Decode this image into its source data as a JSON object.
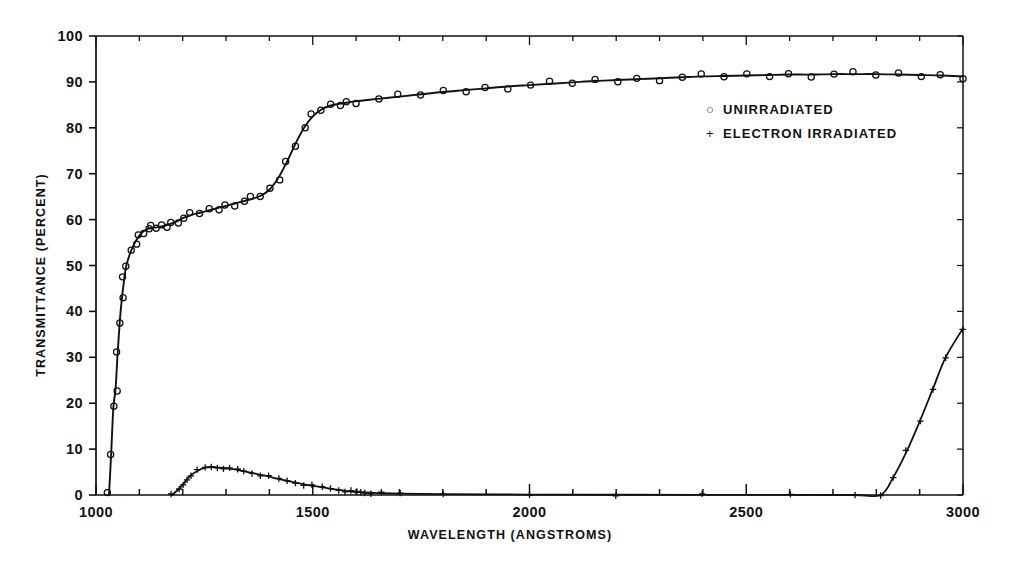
{
  "figure": {
    "background": "#ffffff",
    "ink_color": "#111111"
  },
  "axes": {
    "xlabel": "WAVELENGTH (ANGSTROMS)",
    "ylabel": "TRANSMITTANCE (PERCENT)",
    "x_ticks_major": [
      1000,
      1500,
      2000,
      2500,
      3000
    ],
    "x_tick_labels": [
      "1000",
      "1500",
      "2000",
      "2500",
      "3000"
    ],
    "x_minor_step": 100,
    "y_ticks_major": [
      0,
      10,
      20,
      30,
      40,
      50,
      60,
      70,
      80,
      90,
      100
    ],
    "y_tick_labels": [
      "0",
      "10",
      "20",
      "30",
      "40",
      "50",
      "60",
      "70",
      "80",
      "90",
      "100"
    ],
    "xlim": [
      1000,
      3000
    ],
    "ylim": [
      0,
      100
    ],
    "frame": "left-bottom-top-right-open-right"
  },
  "legend": {
    "position": "upper-right-inside",
    "entries": [
      {
        "marker": "circle-open",
        "marker_glyph": "○",
        "label": "UNIRRADIATED"
      },
      {
        "marker": "plus",
        "marker_glyph": "+",
        "label": "ELECTRON IRRADIATED"
      }
    ]
  },
  "chart_data": {
    "type": "line",
    "title": "",
    "subtitle": "",
    "xlabel": "WAVELENGTH (ANGSTROMS)",
    "ylabel": "TRANSMITTANCE (PERCENT)",
    "xlim": [
      1000,
      3000
    ],
    "ylim": [
      0,
      100
    ],
    "grid": false,
    "legend_position": "upper right",
    "series": [
      {
        "name": "UNIRRADIATED",
        "marker": "circle-open",
        "line": "solid",
        "x": [
          1030,
          1035,
          1040,
          1045,
          1050,
          1055,
          1060,
          1065,
          1070,
          1080,
          1090,
          1100,
          1110,
          1120,
          1130,
          1140,
          1150,
          1160,
          1175,
          1190,
          1200,
          1220,
          1240,
          1260,
          1280,
          1300,
          1320,
          1340,
          1360,
          1380,
          1400,
          1420,
          1440,
          1460,
          1480,
          1500,
          1520,
          1540,
          1560,
          1580,
          1600,
          1650,
          1700,
          1750,
          1800,
          1850,
          1900,
          1950,
          2000,
          2050,
          2100,
          2150,
          2200,
          2250,
          2300,
          2350,
          2400,
          2450,
          2500,
          2550,
          2600,
          2650,
          2700,
          2750,
          2800,
          2850,
          2900,
          2950,
          3000
        ],
        "y": [
          0,
          9,
          19,
          23,
          31,
          38,
          43,
          47,
          50,
          53,
          55,
          56.5,
          57.5,
          58,
          58.2,
          58.3,
          58.5,
          58.7,
          59.2,
          59.8,
          60.3,
          61,
          61.5,
          62,
          62.5,
          63,
          63.5,
          64,
          64.5,
          65.2,
          66.5,
          69,
          72.5,
          76.5,
          80,
          82.5,
          84,
          84.8,
          85.2,
          85.5,
          85.8,
          86.3,
          86.8,
          87.3,
          87.8,
          88.2,
          88.6,
          89,
          89.3,
          89.6,
          89.9,
          90.2,
          90.4,
          90.6,
          90.8,
          91,
          91.2,
          91.3,
          91.4,
          91.5,
          91.6,
          91.6,
          91.7,
          91.7,
          91.7,
          91.6,
          91.5,
          91.4,
          91.2
        ]
      },
      {
        "name": "ELECTRON IRRADIATED",
        "marker": "plus",
        "line": "solid",
        "x": [
          1175,
          1190,
          1200,
          1210,
          1220,
          1235,
          1250,
          1265,
          1280,
          1295,
          1310,
          1325,
          1340,
          1360,
          1380,
          1400,
          1420,
          1440,
          1460,
          1480,
          1500,
          1520,
          1540,
          1560,
          1575,
          1590,
          1600,
          1610,
          1620,
          1635,
          1660,
          1700,
          1800,
          2000,
          2200,
          2400,
          2600,
          2750,
          2810,
          2840,
          2870,
          2900,
          2930,
          2960,
          3000
        ],
        "y": [
          0,
          1.2,
          2.2,
          3.4,
          4.4,
          5.3,
          5.9,
          6.1,
          6.0,
          5.9,
          5.7,
          5.5,
          5.2,
          4.8,
          4.4,
          4.0,
          3.5,
          3.1,
          2.7,
          2.3,
          2.0,
          1.7,
          1.4,
          1.1,
          0.9,
          0.75,
          0.65,
          0.6,
          0.55,
          0.5,
          0.4,
          0.3,
          0.2,
          0.1,
          0.05,
          0.03,
          0.02,
          0.0,
          0.0,
          4.0,
          9.5,
          16.0,
          23.0,
          30.0,
          36.3
        ]
      }
    ]
  }
}
